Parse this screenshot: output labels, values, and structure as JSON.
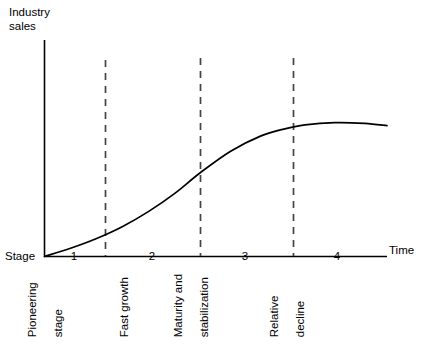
{
  "chart_data": {
    "type": "line",
    "title": "",
    "xlabel": "Time",
    "ylabel": "Industry sales",
    "ylabel_lines": [
      "Industry",
      "sales"
    ],
    "origin_label": "Stage",
    "grid": false,
    "legend": null,
    "xlim": [
      0,
      4.6
    ],
    "ylim": [
      0,
      1.12
    ],
    "axis_ticks_visible": false,
    "stage_boundaries": [
      1.4,
      2.5,
      3.5
    ],
    "categories": [
      "1",
      "2",
      "3",
      "4"
    ],
    "stage_centers": [
      0.7,
      1.95,
      3.0,
      4.05
    ],
    "stage_captions": [
      {
        "number": "1",
        "lines": [
          "Pioneering",
          "stage"
        ]
      },
      {
        "number": "2",
        "lines": [
          "Fast growth"
        ]
      },
      {
        "number": "3",
        "lines": [
          "Maturity and",
          "stabilization"
        ]
      },
      {
        "number": "4",
        "lines": [
          "Relative",
          "decline"
        ]
      }
    ],
    "series": [
      {
        "name": "Industry sales",
        "x": [
          0.0,
          0.35,
          0.7,
          1.05,
          1.4,
          1.75,
          2.1,
          2.5,
          2.9,
          3.2,
          3.5,
          3.9,
          4.3,
          4.6
        ],
        "values": [
          0.0,
          0.055,
          0.12,
          0.2,
          0.3,
          0.42,
          0.56,
          0.7,
          0.8,
          0.845,
          0.875,
          0.89,
          0.885,
          0.87
        ]
      }
    ],
    "annotations": []
  },
  "colors": {
    "curve": "#000000",
    "axis": "#000000",
    "divider": "#555555",
    "background": "#ffffff",
    "text": "#000000"
  }
}
